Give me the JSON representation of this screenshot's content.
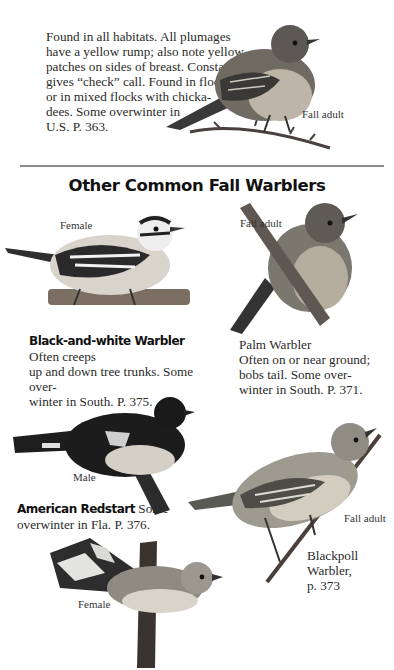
{
  "intro": {
    "lines": [
      "Found in all habitats. All plumages",
      "have a yellow rump; also note yellow",
      "patches on sides of breast. Constantly",
      "gives “check” call. Found in flocks,",
      "or in mixed flocks with chicka-",
      "dees. Some overwinter in",
      "U.S. P. 363."
    ],
    "caption": "Fall adult"
  },
  "section_title": "Other Common Fall Warblers",
  "birds": {
    "black_and_white": {
      "caption": "Female",
      "name": "Black-and-white Warbler",
      "text_l1": "Often creeps",
      "text_l2": "up and down tree trunks. Some over-",
      "text_l3": "winter in South. P. 375."
    },
    "palm": {
      "caption": "Fall adult",
      "name": "Palm Warbler",
      "text_l1": "Often on or near ground;",
      "text_l2": "bobs tail. Some over-",
      "text_l3": "winter in South. P. 371."
    },
    "redstart": {
      "caption_male": "Male",
      "caption_female": "Female",
      "name": "American Redstart",
      "text_l1": "Some",
      "text_l2": "overwinter in Fla. P. 376."
    },
    "blackpoll": {
      "caption": "Fall adult",
      "name_l1": "Blackpoll",
      "name_l2": "Warbler,",
      "page": "p. 373"
    }
  },
  "colors": {
    "rule": "#8a8a8a",
    "text": "#2a2a2a",
    "heading": "#111111"
  }
}
